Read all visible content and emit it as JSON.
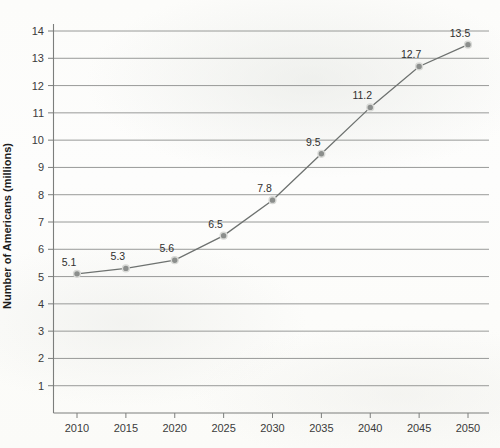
{
  "chart_data": {
    "type": "line",
    "title": "",
    "xlabel": "",
    "ylabel": "Number of Americans (millions)",
    "categories": [
      "2010",
      "2015",
      "2020",
      "2025",
      "2030",
      "2035",
      "2040",
      "2045",
      "2050"
    ],
    "x": [
      2010,
      2015,
      2020,
      2025,
      2030,
      2035,
      2040,
      2045,
      2050
    ],
    "values": [
      5.1,
      5.3,
      5.6,
      6.5,
      7.8,
      9.5,
      11.2,
      12.7,
      13.5
    ],
    "point_labels": [
      "5.1",
      "5.3",
      "5.6",
      "6.5",
      "7.8",
      "9.5",
      "11.2",
      "12.7",
      "13.5"
    ],
    "ylim": [
      0,
      14
    ],
    "ytick_labels": [
      "1",
      "2",
      "3",
      "4",
      "5",
      "6",
      "7",
      "8",
      "9",
      "10",
      "11",
      "12",
      "13",
      "14"
    ],
    "yticks": [
      1,
      2,
      3,
      4,
      5,
      6,
      7,
      8,
      9,
      10,
      11,
      12,
      13,
      14
    ],
    "grid": true,
    "legend": false,
    "legend_position": "none",
    "marker": "circle",
    "colors": {
      "line": "#6e7270",
      "marker_fill": "#8b8e8c",
      "marker_stroke": "#d8d9d6",
      "gridline": "#8d8f8d",
      "axis": "#7c7e7c",
      "text": "#2f2f2f",
      "background": "#fdfdfb"
    }
  }
}
